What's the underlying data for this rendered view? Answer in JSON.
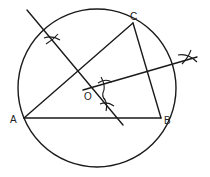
{
  "diagram": {
    "type": "geometric-construction",
    "stroke_color": "#1a1a1a",
    "background": "#ffffff",
    "circle": {
      "cx": 97,
      "cy": 88,
      "r": 79
    },
    "points": {
      "A": {
        "label": "A",
        "x": 24,
        "y": 118
      },
      "B": {
        "label": "B",
        "x": 161,
        "y": 118
      },
      "C": {
        "label": "C",
        "x": 133,
        "y": 23
      },
      "O": {
        "label": "O",
        "x": 97,
        "y": 88
      }
    },
    "triangle_sides": [
      "AB",
      "BC",
      "CA"
    ],
    "bisectors": [
      {
        "name": "perpendicular-bisector-AC",
        "x1": 27,
        "y1": 10,
        "x2": 123,
        "y2": 125
      },
      {
        "name": "perpendicular-bisector-BC",
        "x1": 83,
        "y1": 90,
        "x2": 197,
        "y2": 57
      }
    ],
    "arc_marks": [
      {
        "x": 52,
        "y": 40
      },
      {
        "x": 105,
        "y": 83
      },
      {
        "x": 107,
        "y": 104
      },
      {
        "x": 188,
        "y": 58
      }
    ]
  }
}
